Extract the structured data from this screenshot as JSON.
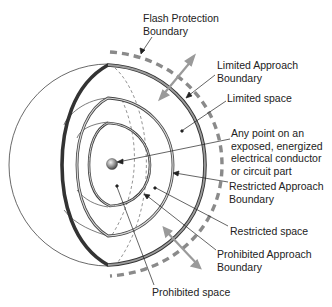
{
  "diagram": {
    "type": "electrical approach boundaries",
    "colors": {
      "outline": "#333333",
      "limited_ring": "#5a5a5a",
      "ring_fill": "#bdbdbd",
      "flash_dash": "#8a8a8a",
      "arrow": "#9a9a9a",
      "background": "#ffffff"
    },
    "labels": {
      "flash_protection": "Flash Protection\nBoundary",
      "limited_approach": "Limited Approach\nBoundary",
      "limited_space": "Limited space",
      "energized_point": "Any point on an\nexposed, energized\nelectrical conductor\nor circuit part",
      "restricted_approach": "Restricted Approach\nBoundary",
      "restricted_space": "Restricted space",
      "prohibited_approach": "Prohibited Approach\nBoundary",
      "prohibited_space": "Prohibited space"
    }
  }
}
